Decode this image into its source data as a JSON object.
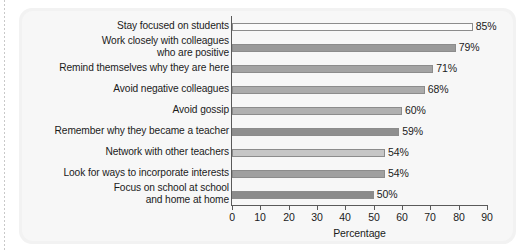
{
  "chart_data": {
    "type": "bar",
    "orientation": "horizontal",
    "title": "",
    "xlabel": "Percentage",
    "ylabel": "",
    "xlim": [
      0,
      90
    ],
    "xticks": [
      0,
      10,
      20,
      30,
      40,
      50,
      60,
      70,
      80,
      90
    ],
    "xtick_labels": [
      "0",
      "10",
      "20",
      "30",
      "40",
      "50",
      "60",
      "70",
      "80",
      "90"
    ],
    "grid": false,
    "legend": null,
    "value_label_suffix": "%",
    "categories": [
      "Stay focused on students",
      "Work closely with colleagues\nwho are positive",
      "Remind themselves why they are here",
      "Avoid negative colleagues",
      "Avoid gossip",
      "Remember why they became a teacher",
      "Network with other teachers",
      "Look for ways to incorporate interests",
      "Focus on school at school\nand home at home"
    ],
    "values": [
      85,
      79,
      71,
      68,
      60,
      59,
      54,
      54,
      50
    ],
    "value_labels": [
      "85%",
      "79%",
      "71%",
      "68%",
      "60%",
      "59%",
      "54%",
      "54%",
      "50%"
    ],
    "bar_colors": [
      "#fbfbfb",
      "#9a9a9a",
      "#a3a3a3",
      "#ababab",
      "#b0b0b0",
      "#8f8f8f",
      "#c6c6c6",
      "#a0a0a0",
      "#8b8b8b"
    ],
    "bar_edge_color": "#8c8c8c",
    "axis_color": "#5a5a5a",
    "text_color": "#1b1b1b",
    "panel_color": "#f2f2f2",
    "background_color": "#ffffff"
  }
}
